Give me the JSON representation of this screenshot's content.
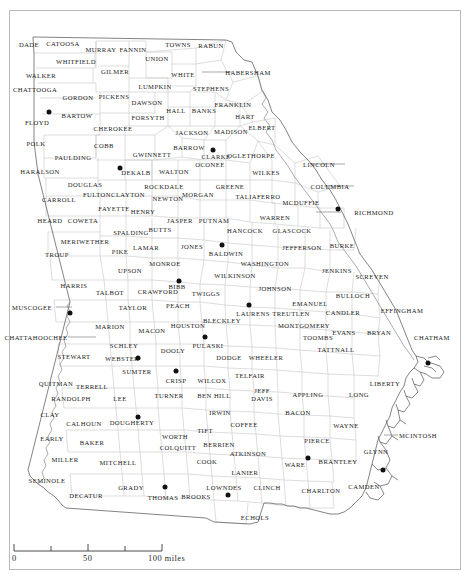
{
  "map": {
    "title": "Georgia counties map",
    "subject": "State of Georgia, USA — county boundaries",
    "border_color": "#b9b9bc",
    "county_line_color": "#c9c9cc",
    "state_line_color": "#6d6d70",
    "label_color": "#1b1b1b",
    "city_dot_color": "#111111",
    "background": "#ffffff"
  },
  "scale_bar": {
    "name": "distance-scale",
    "unit": "miles",
    "ticks": [
      {
        "label": "0",
        "value": 0,
        "x_pct": 0
      },
      {
        "label": "",
        "value": 25,
        "x_pct": 25
      },
      {
        "label": "50",
        "value": 50,
        "x_pct": 50
      },
      {
        "label": "",
        "value": 75,
        "x_pct": 75
      },
      {
        "label": "100 miles",
        "value": 100,
        "x_pct": 100
      }
    ]
  },
  "cities": [
    {
      "name": "floyd-city-dot",
      "county": "Floyd",
      "x": 49,
      "y": 112
    },
    {
      "name": "fulton-city-dot",
      "county": "Fulton",
      "x": 120,
      "y": 168
    },
    {
      "name": "richmond-city-dot",
      "county": "Richmond",
      "x": 338,
      "y": 209
    },
    {
      "name": "clarke-city-dot",
      "county": "Clarke",
      "x": 213,
      "y": 150
    },
    {
      "name": "baldwin-city-dot",
      "county": "Baldwin",
      "x": 222,
      "y": 245
    },
    {
      "name": "bibb-city-dot",
      "county": "Bibb",
      "x": 179,
      "y": 281
    },
    {
      "name": "muscogee-city-dot",
      "county": "Muscogee",
      "x": 70,
      "y": 313
    },
    {
      "name": "laurens-city-dot",
      "county": "Laurens",
      "x": 249,
      "y": 305
    },
    {
      "name": "houston-city-dot",
      "county": "Houston",
      "x": 205,
      "y": 337
    },
    {
      "name": "webster-city-dot",
      "county": "Webster",
      "x": 138,
      "y": 358
    },
    {
      "name": "crisp-city-dot",
      "county": "Crisp",
      "x": 176,
      "y": 371
    },
    {
      "name": "dougherty-city-dot",
      "county": "Dougherty",
      "x": 138,
      "y": 417
    },
    {
      "name": "thomas-city-dot",
      "county": "Thomas",
      "x": 165,
      "y": 487
    },
    {
      "name": "lowndes-city-dot",
      "county": "Lowndes",
      "x": 228,
      "y": 495
    },
    {
      "name": "ware-city-dot",
      "county": "Ware",
      "x": 308,
      "y": 458
    },
    {
      "name": "glynn-city-dot",
      "county": "Glynn",
      "x": 383,
      "y": 470
    },
    {
      "name": "chatham-city-dot",
      "county": "Chatham",
      "x": 428,
      "y": 363
    }
  ],
  "counties": [
    {
      "label": "DADE",
      "x": 29,
      "y": 44
    },
    {
      "label": "CATOOSA",
      "x": 63,
      "y": 43
    },
    {
      "label": "MURRAY",
      "x": 101,
      "y": 49
    },
    {
      "label": "FANNIN",
      "x": 133,
      "y": 49
    },
    {
      "label": "TOWNS",
      "x": 178,
      "y": 44
    },
    {
      "label": "RABUN",
      "x": 211,
      "y": 45
    },
    {
      "label": "WHITFIELD",
      "x": 76,
      "y": 61
    },
    {
      "label": "UNION",
      "x": 157,
      "y": 58
    },
    {
      "label": "WALKER",
      "x": 41,
      "y": 75
    },
    {
      "label": "GILMER",
      "x": 115,
      "y": 71
    },
    {
      "label": "WHITE",
      "x": 183,
      "y": 74
    },
    {
      "label": "HABERSHAM",
      "x": 248,
      "y": 72
    },
    {
      "label": "CHATTOOGA",
      "x": 35,
      "y": 89
    },
    {
      "label": "GORDON",
      "x": 78,
      "y": 97
    },
    {
      "label": "PICKENS",
      "x": 114,
      "y": 96
    },
    {
      "label": "LUMPKIN",
      "x": 155,
      "y": 86
    },
    {
      "label": "STEPHENS",
      "x": 211,
      "y": 88
    },
    {
      "label": "DAWSON",
      "x": 147,
      "y": 102
    },
    {
      "label": "HALL",
      "x": 176,
      "y": 110
    },
    {
      "label": "BANKS",
      "x": 204,
      "y": 110
    },
    {
      "label": "FRANKLIN",
      "x": 233,
      "y": 104
    },
    {
      "label": "FLOYD",
      "x": 37,
      "y": 122
    },
    {
      "label": "BARTOW",
      "x": 77,
      "y": 115
    },
    {
      "label": "FORSYTH",
      "x": 148,
      "y": 117
    },
    {
      "label": "HART",
      "x": 245,
      "y": 116
    },
    {
      "label": "CHEROKEE",
      "x": 113,
      "y": 128
    },
    {
      "label": "JACKSON",
      "x": 192,
      "y": 132
    },
    {
      "label": "MADISON",
      "x": 231,
      "y": 131
    },
    {
      "label": "ELBERT",
      "x": 262,
      "y": 127
    },
    {
      "label": "POLK",
      "x": 36,
      "y": 143
    },
    {
      "label": "COBB",
      "x": 104,
      "y": 145
    },
    {
      "label": "GWINNETT",
      "x": 152,
      "y": 154
    },
    {
      "label": "BARROW",
      "x": 189,
      "y": 147
    },
    {
      "label": "CLARKE",
      "x": 216,
      "y": 156
    },
    {
      "label": "OGLETHORPE",
      "x": 251,
      "y": 155
    },
    {
      "label": "PAULDING",
      "x": 73,
      "y": 157
    },
    {
      "label": "OCONEE",
      "x": 210,
      "y": 164
    },
    {
      "label": "LINCOLN",
      "x": 319,
      "y": 164
    },
    {
      "label": "HARALSON",
      "x": 40,
      "y": 171
    },
    {
      "label": "DEKALB",
      "x": 136,
      "y": 172
    },
    {
      "label": "WALTON",
      "x": 174,
      "y": 171
    },
    {
      "label": "WILKES",
      "x": 266,
      "y": 172
    },
    {
      "label": "DOUGLAS",
      "x": 85,
      "y": 184
    },
    {
      "label": "ROCKDALE",
      "x": 164,
      "y": 186
    },
    {
      "label": "GREENE",
      "x": 230,
      "y": 186
    },
    {
      "label": "COLUMBIA",
      "x": 330,
      "y": 186
    },
    {
      "label": "FULTON",
      "x": 97,
      "y": 194
    },
    {
      "label": "CLAYTON",
      "x": 128,
      "y": 194
    },
    {
      "label": "MORGAN",
      "x": 198,
      "y": 194
    },
    {
      "label": "NEWTON",
      "x": 168,
      "y": 198
    },
    {
      "label": "TALIAFERRO",
      "x": 258,
      "y": 196
    },
    {
      "label": "MCDUFFIE",
      "x": 301,
      "y": 202
    },
    {
      "label": "FAYETTE",
      "x": 114,
      "y": 208
    },
    {
      "label": "HENRY",
      "x": 143,
      "y": 211
    },
    {
      "label": "RICHMOND",
      "x": 374,
      "y": 212
    },
    {
      "label": "CARROLL",
      "x": 59,
      "y": 199
    },
    {
      "label": "HEARD",
      "x": 50,
      "y": 220
    },
    {
      "label": "COWETA",
      "x": 83,
      "y": 220
    },
    {
      "label": "JASPER",
      "x": 180,
      "y": 220
    },
    {
      "label": "PUTNAM",
      "x": 214,
      "y": 220
    },
    {
      "label": "WARREN",
      "x": 275,
      "y": 217
    },
    {
      "label": "BUTTS",
      "x": 160,
      "y": 229
    },
    {
      "label": "SPALDING",
      "x": 131,
      "y": 232
    },
    {
      "label": "HANCOCK",
      "x": 245,
      "y": 230
    },
    {
      "label": "GLASCOCK",
      "x": 292,
      "y": 230
    },
    {
      "label": "MERIWETHER",
      "x": 85,
      "y": 241
    },
    {
      "label": "LAMAR",
      "x": 146,
      "y": 247
    },
    {
      "label": "JONES",
      "x": 192,
      "y": 246
    },
    {
      "label": "BALDWIN",
      "x": 226,
      "y": 253
    },
    {
      "label": "JEFFERSON",
      "x": 302,
      "y": 247
    },
    {
      "label": "BURKE",
      "x": 342,
      "y": 245
    },
    {
      "label": "PIKE",
      "x": 120,
      "y": 251
    },
    {
      "label": "TROUP",
      "x": 57,
      "y": 254
    },
    {
      "label": "MONROE",
      "x": 165,
      "y": 263
    },
    {
      "label": "WASHINGTON",
      "x": 265,
      "y": 263
    },
    {
      "label": "UPSON",
      "x": 130,
      "y": 270
    },
    {
      "label": "BIBB",
      "x": 177,
      "y": 286
    },
    {
      "label": "WILKINSON",
      "x": 235,
      "y": 275
    },
    {
      "label": "JENKINS",
      "x": 337,
      "y": 270
    },
    {
      "label": "SCREVEN",
      "x": 372,
      "y": 276
    },
    {
      "label": "CRAWFORD",
      "x": 158,
      "y": 291
    },
    {
      "label": "TWIGGS",
      "x": 206,
      "y": 293
    },
    {
      "label": "HARRIS",
      "x": 74,
      "y": 285
    },
    {
      "label": "TALBOT",
      "x": 110,
      "y": 292
    },
    {
      "label": "JOHNSON",
      "x": 275,
      "y": 288
    },
    {
      "label": "EMANUEL",
      "x": 310,
      "y": 303
    },
    {
      "label": "BULLOCH",
      "x": 353,
      "y": 295
    },
    {
      "label": "MUSCOGEE",
      "x": 32,
      "y": 307
    },
    {
      "label": "TAYLOR",
      "x": 133,
      "y": 307
    },
    {
      "label": "PEACH",
      "x": 178,
      "y": 305
    },
    {
      "label": "LAURENS",
      "x": 253,
      "y": 313
    },
    {
      "label": "TREUTLEN",
      "x": 291,
      "y": 313
    },
    {
      "label": "CANDLER",
      "x": 343,
      "y": 312
    },
    {
      "label": "EFFINGHAM",
      "x": 402,
      "y": 310
    },
    {
      "label": "BLECKLEY",
      "x": 222,
      "y": 320
    },
    {
      "label": "MONTGOMERY",
      "x": 304,
      "y": 325
    },
    {
      "label": "CHATTAHOOCHEE",
      "x": 36,
      "y": 337
    },
    {
      "label": "MARION",
      "x": 110,
      "y": 326
    },
    {
      "label": "MACON",
      "x": 152,
      "y": 330
    },
    {
      "label": "HOUSTON",
      "x": 188,
      "y": 325
    },
    {
      "label": "EVANS",
      "x": 344,
      "y": 332
    },
    {
      "label": "BRYAN",
      "x": 379,
      "y": 332
    },
    {
      "label": "TOOMBS",
      "x": 318,
      "y": 337
    },
    {
      "label": "CHATHAM",
      "x": 432,
      "y": 337
    },
    {
      "label": "SCHLEY",
      "x": 124,
      "y": 345
    },
    {
      "label": "DOOLY",
      "x": 173,
      "y": 350
    },
    {
      "label": "PULASKI",
      "x": 208,
      "y": 345
    },
    {
      "label": "WEBSTER",
      "x": 122,
      "y": 358
    },
    {
      "label": "DODGE",
      "x": 229,
      "y": 357
    },
    {
      "label": "WHEELER",
      "x": 266,
      "y": 357
    },
    {
      "label": "TATTNALL",
      "x": 336,
      "y": 349
    },
    {
      "label": "STEWART",
      "x": 74,
      "y": 356
    },
    {
      "label": "SUMTER",
      "x": 137,
      "y": 371
    },
    {
      "label": "TELFAIR",
      "x": 250,
      "y": 375
    },
    {
      "label": "WILCOX",
      "x": 212,
      "y": 380
    },
    {
      "label": "LIBERTY",
      "x": 385,
      "y": 383
    },
    {
      "label": "QUITMAN",
      "x": 56,
      "y": 383
    },
    {
      "label": "TERRELL",
      "x": 92,
      "y": 386
    },
    {
      "label": "CRISP",
      "x": 176,
      "y": 380
    },
    {
      "label": "RANDOLPH",
      "x": 71,
      "y": 398
    },
    {
      "label": "LEE",
      "x": 120,
      "y": 398
    },
    {
      "label": "TURNER",
      "x": 169,
      "y": 395
    },
    {
      "label": "BEN HILL",
      "x": 214,
      "y": 395
    },
    {
      "label": "JEFF",
      "x": 262,
      "y": 390
    },
    {
      "label": "DAVIS",
      "x": 262,
      "y": 398
    },
    {
      "label": "APPLING",
      "x": 308,
      "y": 394
    },
    {
      "label": "LONG",
      "x": 359,
      "y": 394
    },
    {
      "label": "CLAY",
      "x": 50,
      "y": 414
    },
    {
      "label": "IRWIN",
      "x": 220,
      "y": 412
    },
    {
      "label": "BACON",
      "x": 298,
      "y": 412
    },
    {
      "label": "CALHOUN",
      "x": 84,
      "y": 423
    },
    {
      "label": "DOUGHERTY",
      "x": 132,
      "y": 422
    },
    {
      "label": "COFFEE",
      "x": 244,
      "y": 424
    },
    {
      "label": "WAYNE",
      "x": 346,
      "y": 425
    },
    {
      "label": "MCINTOSH",
      "x": 418,
      "y": 435
    },
    {
      "label": "EARLY",
      "x": 52,
      "y": 438
    },
    {
      "label": "WORTH",
      "x": 175,
      "y": 436
    },
    {
      "label": "TIFT",
      "x": 205,
      "y": 430
    },
    {
      "label": "PIERCE",
      "x": 317,
      "y": 440
    },
    {
      "label": "BAKER",
      "x": 92,
      "y": 442
    },
    {
      "label": "COLQUITT",
      "x": 178,
      "y": 447
    },
    {
      "label": "BERRIEN",
      "x": 219,
      "y": 444
    },
    {
      "label": "GLYNN",
      "x": 376,
      "y": 451
    },
    {
      "label": "MILLER",
      "x": 65,
      "y": 459
    },
    {
      "label": "MITCHELL",
      "x": 118,
      "y": 462
    },
    {
      "label": "COOK",
      "x": 207,
      "y": 461
    },
    {
      "label": "ATKINSON",
      "x": 248,
      "y": 453
    },
    {
      "label": "BRANTLEY",
      "x": 338,
      "y": 461
    },
    {
      "label": "SEMINOLE",
      "x": 47,
      "y": 480
    },
    {
      "label": "LANIER",
      "x": 245,
      "y": 472
    },
    {
      "label": "WARE",
      "x": 295,
      "y": 464
    },
    {
      "label": "DECATUR",
      "x": 86,
      "y": 495
    },
    {
      "label": "GRADY",
      "x": 131,
      "y": 487
    },
    {
      "label": "LOWNDES",
      "x": 224,
      "y": 487
    },
    {
      "label": "CLINCH",
      "x": 267,
      "y": 487
    },
    {
      "label": "CAMDEN",
      "x": 364,
      "y": 486
    },
    {
      "label": "CHARLTON",
      "x": 321,
      "y": 490
    },
    {
      "label": "THOMAS",
      "x": 163,
      "y": 497
    },
    {
      "label": "BROOKS",
      "x": 196,
      "y": 496
    },
    {
      "label": "ECHOLS",
      "x": 255,
      "y": 517
    }
  ]
}
